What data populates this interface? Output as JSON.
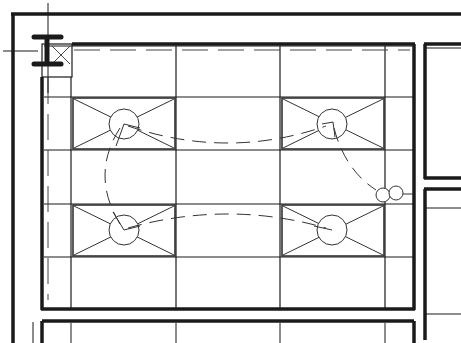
{
  "drawing": {
    "type": "reflected-ceiling-plan",
    "width": 461,
    "height": 343,
    "background": "#ffffff",
    "line_color": "#1a1a1a",
    "fixture_color": "#333333",
    "text_labels": []
  },
  "walls": {
    "outer_top_y": 14,
    "outer_left_x": 13,
    "room_inner": {
      "x1": 42,
      "y1": 44,
      "x2": 415,
      "y2": 309
    },
    "right_room_left_x": 424,
    "right_room_top_y": 44,
    "corridor_y1": 179,
    "corridor_y2": 189,
    "bottom_room_top_y": 321
  },
  "ceiling_grid": {
    "vertical_lines_x": [
      71,
      176,
      280,
      385
    ],
    "horizontal_lines_y": [
      97,
      150,
      204,
      257
    ]
  },
  "column": {
    "x": 43,
    "y": 50,
    "label": ""
  },
  "light_fixtures": [
    {
      "id": "fixture-1",
      "x": 73,
      "y": 98,
      "w": 102,
      "h": 51,
      "cx": 124,
      "cy": 124,
      "r": 15
    },
    {
      "id": "fixture-2",
      "x": 282,
      "y": 98,
      "w": 102,
      "h": 51,
      "cx": 332,
      "cy": 124,
      "r": 15
    },
    {
      "id": "fixture-3",
      "x": 73,
      "y": 205,
      "w": 102,
      "h": 51,
      "cx": 124,
      "cy": 230,
      "r": 15
    },
    {
      "id": "fixture-4",
      "x": 282,
      "y": 205,
      "w": 102,
      "h": 51,
      "cx": 332,
      "cy": 230,
      "r": 15
    }
  ],
  "switch": {
    "cx": 383,
    "cy": 195,
    "r": 7,
    "cx2": 396,
    "cy2": 193,
    "r2": 7
  }
}
